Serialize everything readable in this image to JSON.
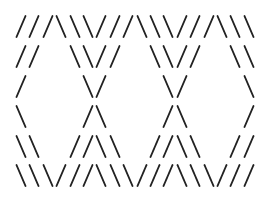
{
  "pattern": {
    "description": "ASCII-art diamond lattice made of slash and backslash characters",
    "stroke_color": "#222222",
    "background_color": "#ffffff",
    "rows": [
      "///\\\\\\///\\\\\\///\\\\\\",
      "//  \\\\//  \\\\//  \\\\",
      "/    \\/    \\/    \\",
      "\\    /\\    /\\    /",
      "\\\\  //\\\\  //\\\\  //",
      "\\\\\\///\\\\\\///\\\\\\///"
    ]
  }
}
